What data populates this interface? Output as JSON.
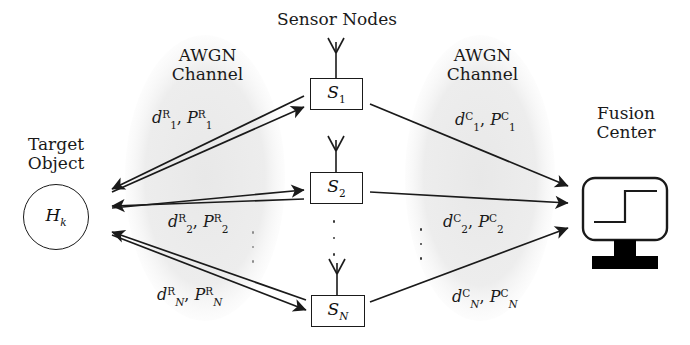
{
  "diagram": {
    "background_color": "#ffffff",
    "stroke_color": "#1a1a1a",
    "cloud_fill_color": "#ededed"
  },
  "labels": {
    "sensor_nodes": "Sensor Nodes",
    "target_object_line1": "Target",
    "target_object_line2": "Object",
    "fusion_center_line1": "Fusion",
    "fusion_center_line2": "Center",
    "awgn_left_line1": "AWGN",
    "awgn_left_line2": "Channel",
    "awgn_right_line1": "AWGN",
    "awgn_right_line2": "Channel"
  },
  "target": {
    "symbol_base": "H",
    "symbol_sub": "k"
  },
  "sensors": [
    {
      "name": "sensor-1",
      "symbol_base": "S",
      "symbol_sub": "1"
    },
    {
      "name": "sensor-2",
      "symbol_base": "S",
      "symbol_sub": "2"
    },
    {
      "name": "sensor-N",
      "symbol_base": "S",
      "symbol_sub": "N"
    }
  ],
  "left_channel_labels": [
    {
      "d_base": "d",
      "d_sup": "R",
      "d_sub": "1",
      "sep": ", ",
      "p_base": "P",
      "p_sup": "R",
      "p_sub": "1"
    },
    {
      "d_base": "d",
      "d_sup": "R",
      "d_sub": "2",
      "sep": ", ",
      "p_base": "P",
      "p_sup": "R",
      "p_sub": "2"
    },
    {
      "d_base": "d",
      "d_sup": "R",
      "d_sub": "N",
      "sep": ", ",
      "p_base": "P",
      "p_sup": "R",
      "p_sub": "N"
    }
  ],
  "right_channel_labels": [
    {
      "d_base": "d",
      "d_sup": "C",
      "d_sub": "1",
      "sep": ", ",
      "p_base": "P",
      "p_sup": "C",
      "p_sub": "1"
    },
    {
      "d_base": "d",
      "d_sup": "C",
      "d_sub": "2",
      "sep": ", ",
      "p_base": "P",
      "p_sup": "C",
      "p_sub": "2"
    },
    {
      "d_base": "d",
      "d_sup": "C",
      "d_sub": "N",
      "sep": ", ",
      "p_base": "P",
      "p_sup": "C",
      "p_sub": "N"
    }
  ],
  "ellipsis": {
    "glyph": "·",
    "count": 3
  },
  "icons": {
    "antenna": "antenna-icon",
    "monitor": "monitor-icon",
    "step_waveform": "step-waveform-icon"
  }
}
